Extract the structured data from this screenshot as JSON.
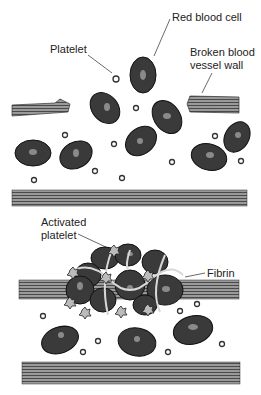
{
  "panels": {
    "top": {
      "title": "Injury",
      "labels": {
        "red_blood_cell": "Red blood cell",
        "platelet": "Platelet",
        "broken_wall_line1": "Broken blood",
        "broken_wall_line2": "vessel wall"
      }
    },
    "bottom": {
      "title": "Clot",
      "labels": {
        "activated_platelet_line1": "Activated",
        "activated_platelet_line2": "platelet",
        "fibrin": "Fibrin"
      }
    }
  },
  "colors": {
    "cell_fill": "#3a3a3a",
    "cell_outline": "#111111",
    "wall_fill": "#8a8a8a",
    "fibrin": "#d8d8d8",
    "background": "#ffffff"
  }
}
